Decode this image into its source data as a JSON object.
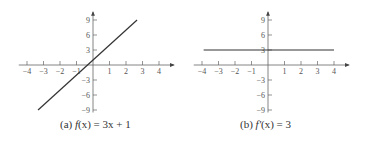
{
  "chart_data": [
    {
      "type": "line",
      "title": "(a) f(x) = 3x + 1",
      "caption_prefix": "(a)",
      "caption_fn": "f",
      "caption_rest": "(x) = 3x + 1",
      "xlabel": "",
      "ylabel": "",
      "xlim": [
        -4,
        4
      ],
      "ylim": [
        -9,
        9
      ],
      "x_ticks": [
        -4,
        -3,
        -2,
        -1,
        1,
        2,
        3,
        4
      ],
      "y_ticks": [
        9,
        6,
        3,
        -3,
        -6,
        -9
      ],
      "series": [
        {
          "name": "f(x) = 3x + 1",
          "x": [
            -3.33,
            2.67
          ],
          "y": [
            -9,
            9
          ],
          "slope": 3,
          "intercept": 1
        }
      ],
      "grid": false,
      "legend": "none"
    },
    {
      "type": "line",
      "title": "(b) f′(x) = 3",
      "caption_prefix": "(b)",
      "caption_fn": "f′",
      "caption_rest": "(x) = 3",
      "xlabel": "",
      "ylabel": "",
      "xlim": [
        -4,
        4
      ],
      "ylim": [
        -9,
        9
      ],
      "x_ticks": [
        -4,
        -3,
        -2,
        -1,
        1,
        2,
        3,
        4
      ],
      "y_ticks": [
        9,
        6,
        3,
        -3,
        -6,
        -9
      ],
      "series": [
        {
          "name": "f′(x) = 3",
          "x": [
            -3.9,
            4
          ],
          "y": [
            3,
            3
          ],
          "slope": 0,
          "intercept": 3
        }
      ],
      "grid": false,
      "legend": "none"
    }
  ],
  "colors": {
    "axis": "#666666",
    "line": "#333333",
    "text": "#555555"
  }
}
